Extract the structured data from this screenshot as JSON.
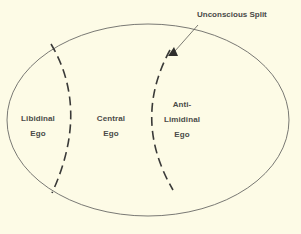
{
  "diagram": {
    "callout": "Unconscious Split",
    "regions": [
      {
        "line1": "Libidinal",
        "line2": "Ego"
      },
      {
        "line1": "Central",
        "line2": "Ego"
      },
      {
        "line1": "Anti-",
        "line2": "Limidinal",
        "line3": "Ego"
      }
    ]
  },
  "colors": {
    "background": "#fdfbe6",
    "stroke": "#5a5a56",
    "dash": "#3a3a38",
    "text": "#4a4a48"
  }
}
